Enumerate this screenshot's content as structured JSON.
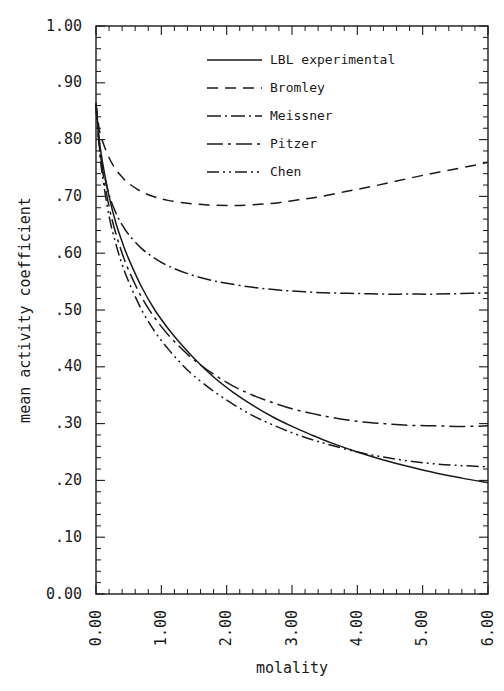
{
  "chart_data": {
    "type": "line",
    "title": "",
    "xlabel": "molality",
    "ylabel": "mean activity coefficient",
    "xlim": [
      0.0,
      6.0
    ],
    "ylim": [
      0.0,
      1.0
    ],
    "grid": false,
    "legend_position": "top-center",
    "xticks": [
      0.0,
      1.0,
      2.0,
      3.0,
      4.0,
      5.0,
      6.0
    ],
    "xtick_labels": [
      "0.00",
      "1.00",
      "2.00",
      "3.00",
      "4.00",
      "5.00",
      "6.00"
    ],
    "x_minor_per_major": 5,
    "yticks": [
      0.0,
      0.1,
      0.2,
      0.3,
      0.4,
      0.5,
      0.6,
      0.7,
      0.8,
      0.9,
      1.0
    ],
    "ytick_labels": [
      "0.00",
      ".10",
      ".20",
      ".30",
      ".40",
      ".50",
      ".60",
      ".70",
      ".80",
      ".90",
      "1.00"
    ],
    "y_minor_per_major": 5,
    "series": [
      {
        "name": "LBL experimental",
        "dash": "solid",
        "dasharray": "",
        "x": [
          0.0,
          0.05,
          0.1,
          0.2,
          0.3,
          0.4,
          0.5,
          0.7,
          0.9,
          1.1,
          1.3,
          1.5,
          1.8,
          2.1,
          2.4,
          2.7,
          3.0,
          3.3,
          3.6,
          4.0,
          4.4,
          4.8,
          5.2,
          5.6,
          6.0
        ],
        "y": [
          0.865,
          0.8,
          0.76,
          0.7,
          0.655,
          0.62,
          0.59,
          0.54,
          0.5,
          0.468,
          0.44,
          0.415,
          0.382,
          0.355,
          0.332,
          0.312,
          0.295,
          0.28,
          0.266,
          0.25,
          0.236,
          0.224,
          0.213,
          0.204,
          0.196
        ]
      },
      {
        "name": "Bromley",
        "dash": "dashed",
        "dasharray": "11,7",
        "x": [
          0.0,
          0.05,
          0.1,
          0.2,
          0.3,
          0.4,
          0.5,
          0.7,
          0.9,
          1.1,
          1.4,
          1.7,
          2.0,
          2.2,
          2.5,
          2.8,
          3.1,
          3.4,
          3.8,
          4.2,
          4.6,
          5.0,
          5.4,
          5.8,
          6.0
        ],
        "y": [
          0.862,
          0.818,
          0.797,
          0.768,
          0.748,
          0.734,
          0.723,
          0.708,
          0.699,
          0.693,
          0.688,
          0.685,
          0.684,
          0.684,
          0.686,
          0.689,
          0.694,
          0.699,
          0.708,
          0.717,
          0.727,
          0.737,
          0.746,
          0.755,
          0.76
        ]
      },
      {
        "name": "Meissner",
        "dash": "dash-dot",
        "dasharray": "14,4,2,4",
        "x": [
          0.0,
          0.05,
          0.1,
          0.2,
          0.3,
          0.4,
          0.5,
          0.7,
          0.9,
          1.1,
          1.4,
          1.7,
          2.0,
          2.4,
          2.8,
          3.2,
          3.6,
          4.0,
          4.4,
          4.8,
          5.2,
          5.6,
          6.0
        ],
        "y": [
          0.858,
          0.79,
          0.752,
          0.703,
          0.672,
          0.65,
          0.633,
          0.608,
          0.591,
          0.578,
          0.564,
          0.554,
          0.547,
          0.54,
          0.535,
          0.532,
          0.53,
          0.529,
          0.528,
          0.528,
          0.528,
          0.529,
          0.53
        ]
      },
      {
        "name": "Pitzer",
        "dash": "dash-dot-long",
        "dasharray": "16,5,3,5",
        "x": [
          0.0,
          0.05,
          0.1,
          0.2,
          0.3,
          0.4,
          0.5,
          0.7,
          0.9,
          1.1,
          1.3,
          1.5,
          1.8,
          2.1,
          2.4,
          2.7,
          3.0,
          3.3,
          3.6,
          4.0,
          4.4,
          4.8,
          5.2,
          5.6,
          6.0
        ],
        "y": [
          0.862,
          0.79,
          0.745,
          0.682,
          0.636,
          0.6,
          0.57,
          0.522,
          0.486,
          0.457,
          0.433,
          0.412,
          0.387,
          0.366,
          0.35,
          0.337,
          0.326,
          0.318,
          0.311,
          0.304,
          0.3,
          0.297,
          0.296,
          0.295,
          0.296
        ]
      },
      {
        "name": "Chen",
        "dash": "dash-dot-dot",
        "dasharray": "12,4,2,4,2,4",
        "x": [
          0.0,
          0.05,
          0.1,
          0.2,
          0.3,
          0.4,
          0.5,
          0.7,
          0.9,
          1.1,
          1.3,
          1.5,
          1.8,
          2.1,
          2.4,
          2.7,
          3.0,
          3.3,
          3.6,
          4.0,
          4.4,
          4.8,
          5.2,
          5.6,
          6.0
        ],
        "y": [
          0.86,
          0.785,
          0.735,
          0.665,
          0.618,
          0.58,
          0.55,
          0.5,
          0.462,
          0.432,
          0.406,
          0.384,
          0.357,
          0.334,
          0.314,
          0.298,
          0.284,
          0.272,
          0.262,
          0.25,
          0.241,
          0.234,
          0.229,
          0.226,
          0.224
        ]
      }
    ]
  },
  "legend": {
    "items": [
      {
        "label": "LBL experimental"
      },
      {
        "label": "Bromley"
      },
      {
        "label": "Meissner"
      },
      {
        "label": "Pitzer"
      },
      {
        "label": "Chen"
      }
    ]
  }
}
